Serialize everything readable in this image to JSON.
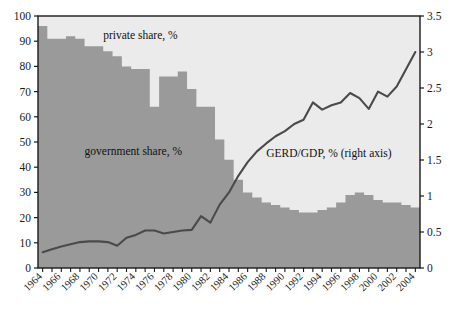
{
  "chart_data": {
    "type": "area",
    "title": "",
    "subtitle": "",
    "xlabel": "",
    "ylabel": "",
    "grid": false,
    "legend_position": "inline-annotations",
    "x": [
      1964,
      1965,
      1966,
      1967,
      1968,
      1969,
      1970,
      1971,
      1972,
      1973,
      1974,
      1975,
      1976,
      1977,
      1978,
      1979,
      1980,
      1981,
      1982,
      1983,
      1984,
      1985,
      1986,
      1987,
      1988,
      1989,
      1990,
      1991,
      1992,
      1993,
      1994,
      1995,
      1996,
      1997,
      1998,
      1999,
      2000,
      2001,
      2002,
      2003,
      2004
    ],
    "xtick_labels": [
      "1964",
      "1966",
      "1968",
      "1970",
      "1972",
      "1974",
      "1976",
      "1978",
      "1980",
      "1982",
      "1984",
      "1986",
      "1988",
      "1990",
      "1992",
      "1994",
      "1996",
      "1998",
      "2000",
      "2002",
      "2004"
    ],
    "left_axis": {
      "label": "",
      "ylim": [
        0,
        100
      ],
      "ticks": [
        0,
        10,
        20,
        30,
        40,
        50,
        60,
        70,
        80,
        90,
        100
      ],
      "tick_labels": [
        "0",
        "10",
        "20",
        "30",
        "40",
        "50",
        "60",
        "70",
        "80",
        "90",
        "100"
      ]
    },
    "right_axis": {
      "label": "",
      "ylim": [
        0,
        3.5
      ],
      "ticks": [
        0,
        0.5,
        1,
        1.5,
        2,
        2.5,
        3,
        3.5
      ],
      "tick_labels": [
        "0",
        "0.5",
        "1",
        "1.5",
        "2",
        "2.5",
        "3",
        "3.5"
      ]
    },
    "series": [
      {
        "name": "government share, %",
        "kind": "area",
        "axis": "left",
        "color": "#9a9a9a",
        "values": [
          96,
          91,
          91,
          92,
          91,
          88,
          88,
          86,
          84,
          80,
          79,
          79,
          64,
          76,
          76,
          78,
          71,
          64,
          64,
          51,
          43,
          35,
          30,
          28,
          26,
          25,
          24,
          23,
          22,
          22,
          23,
          24,
          26,
          29,
          30,
          29,
          27,
          26,
          26,
          25,
          24
        ]
      },
      {
        "name": "private share, %",
        "kind": "area",
        "axis": "left",
        "color": "#ebebeb",
        "values": [
          4,
          9,
          9,
          8,
          9,
          12,
          12,
          14,
          16,
          20,
          21,
          21,
          36,
          24,
          24,
          22,
          29,
          36,
          36,
          49,
          57,
          65,
          70,
          72,
          74,
          75,
          76,
          77,
          78,
          78,
          77,
          76,
          74,
          71,
          70,
          71,
          73,
          74,
          74,
          75,
          76
        ]
      },
      {
        "name": "GERD/GDP, % (right axis)",
        "kind": "line",
        "axis": "right",
        "color": "#4a4a4a",
        "values": [
          0.22,
          0.26,
          0.3,
          0.33,
          0.36,
          0.37,
          0.37,
          0.36,
          0.31,
          0.42,
          0.46,
          0.52,
          0.52,
          0.48,
          0.5,
          0.52,
          0.53,
          0.72,
          0.63,
          0.88,
          1.05,
          1.28,
          1.47,
          1.62,
          1.73,
          1.83,
          1.9,
          2.0,
          2.06,
          2.3,
          2.2,
          2.26,
          2.3,
          2.43,
          2.36,
          2.21,
          2.45,
          2.38,
          2.52,
          2.76,
          3.0
        ]
      }
    ],
    "annotations": [
      {
        "text": "private share, %",
        "x": 1970.5,
        "y_left": 91
      },
      {
        "text": "government share, %",
        "x": 1968.5,
        "y_left": 45
      },
      {
        "text": "GERD/GDP, % (right axis)",
        "x": 1988.0,
        "y_left": 44
      }
    ]
  },
  "colors": {
    "government_area": "#9a9a9a",
    "private_area": "#ebebeb",
    "line": "#4a4a4a",
    "axis": "#1a1a1a",
    "text": "#111111",
    "background": "#ffffff"
  }
}
